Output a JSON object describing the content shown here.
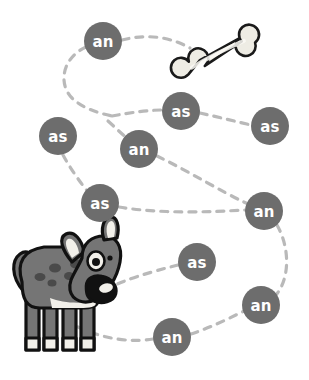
{
  "activity": {
    "title": "Dog and Bone Word Path",
    "background_color": "#ffffff",
    "node_fill": "#6d6d6d",
    "node_text_color": "#ffffff",
    "path_color": "#b9b9b9"
  },
  "nodes": [
    {
      "label": "an",
      "cx": 103,
      "cy": 41,
      "r": 19
    },
    {
      "label": "as",
      "cx": 181,
      "cy": 111,
      "r": 19
    },
    {
      "label": "as",
      "cx": 270,
      "cy": 126,
      "r": 19
    },
    {
      "label": "as",
      "cx": 58,
      "cy": 136,
      "r": 19
    },
    {
      "label": "an",
      "cx": 139,
      "cy": 149,
      "r": 19
    },
    {
      "label": "as",
      "cx": 100,
      "cy": 203,
      "r": 19
    },
    {
      "label": "an",
      "cx": 264,
      "cy": 211,
      "r": 19
    },
    {
      "label": "as",
      "cx": 197,
      "cy": 262,
      "r": 19
    },
    {
      "label": "an",
      "cx": 261,
      "cy": 305,
      "r": 19
    },
    {
      "label": "an",
      "cx": 172,
      "cy": 337,
      "r": 19
    }
  ],
  "bone": {
    "name": "bone",
    "fill": "#eeece4",
    "highlight": "#f8f7f2",
    "outline": "#1a1a1a",
    "cx": 221,
    "cy": 51
  },
  "dog": {
    "name": "dog",
    "body_fill": "#757575",
    "belly_fill": "#f2f0ea",
    "outline": "#111111",
    "spot_fill": "#4a4a4a",
    "eye_white": "#f2f0ea",
    "eye_pupil": "#111111",
    "nose_fill": "#111111",
    "nose_shine": "#f2f0ea"
  }
}
